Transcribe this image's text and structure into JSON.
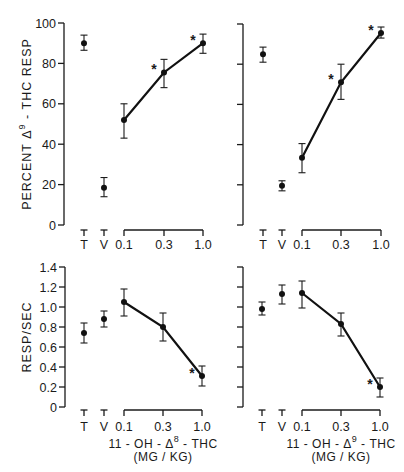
{
  "figure": {
    "background": "#ffffff",
    "ink": "#111111"
  },
  "chart_data": [
    {
      "id": "top-left",
      "type": "scatter",
      "title": "",
      "ylabel": "PERCENT Δ9 - THC RESP",
      "ylabel_parts": {
        "pre": "PERCENT Δ",
        "sup": "9",
        "post": " - THC RESP"
      },
      "xlabel": "",
      "ylim": [
        0,
        100
      ],
      "yticks": [
        0,
        20,
        40,
        60,
        80,
        100
      ],
      "ytick_labels": [
        "0",
        "20",
        "40",
        "60",
        "80",
        "100"
      ],
      "controls": [
        {
          "label": "T",
          "value": 90,
          "err_low": 86.5,
          "err_high": 94
        },
        {
          "label": "V",
          "value": 18.5,
          "err_low": 14,
          "err_high": 23.5
        }
      ],
      "dose_ticks": [
        "0.1",
        "0.3",
        "1.0"
      ],
      "series": [
        {
          "name": "11-OH-Δ8-THC",
          "x": [
            0.1,
            0.3,
            1.0
          ],
          "values": [
            52,
            75.5,
            90
          ],
          "err_low": [
            43,
            68,
            85
          ],
          "err_high": [
            60,
            82,
            94.5
          ],
          "significant": [
            false,
            true,
            true
          ]
        }
      ]
    },
    {
      "id": "top-right",
      "type": "scatter",
      "title": "",
      "ylabel": "",
      "xlabel": "",
      "ylim": [
        0,
        100
      ],
      "yticks": [
        0,
        20,
        40,
        60,
        80,
        100
      ],
      "ytick_labels": [],
      "controls": [
        {
          "label": "T",
          "value": 85,
          "err_low": 81,
          "err_high": 88.5
        },
        {
          "label": "V",
          "value": 19.5,
          "err_low": 17,
          "err_high": 22
        }
      ],
      "dose_ticks": [
        "0.1",
        "0.3",
        "1.0"
      ],
      "series": [
        {
          "name": "11-OH-Δ9-THC",
          "x": [
            0.1,
            0.3,
            1.0
          ],
          "values": [
            33.5,
            71,
            95.5
          ],
          "err_low": [
            26,
            62.5,
            93
          ],
          "err_high": [
            40.5,
            80,
            98.5
          ],
          "significant": [
            false,
            true,
            true
          ]
        }
      ]
    },
    {
      "id": "bottom-left",
      "type": "scatter",
      "title": "",
      "ylabel": "RESP/SEC",
      "ylabel_parts": {
        "pre": "RESP/SEC",
        "sup": "",
        "post": ""
      },
      "xlabel": "11 - OH - Δ8 - THC (MG / KG)",
      "xlabel_parts": {
        "pre": "11 - OH - Δ",
        "sup": "8",
        "post": " - THC",
        "units": "(MG / KG)"
      },
      "ylim": [
        0,
        1.4
      ],
      "yticks": [
        0,
        0.2,
        0.4,
        0.6,
        0.8,
        1.0,
        1.2,
        1.4
      ],
      "ytick_labels": [
        "0",
        "0.2",
        "0.4",
        "0.6",
        "0.8",
        "1.0",
        "1.2",
        "1.4"
      ],
      "controls": [
        {
          "label": "T",
          "value": 0.74,
          "err_low": 0.64,
          "err_high": 0.84
        },
        {
          "label": "V",
          "value": 0.88,
          "err_low": 0.8,
          "err_high": 0.96
        }
      ],
      "dose_ticks": [
        "0.1",
        "0.3",
        "1.0"
      ],
      "series": [
        {
          "name": "11-OH-Δ8-THC",
          "x": [
            0.1,
            0.3,
            1.0
          ],
          "values": [
            1.05,
            0.8,
            0.31
          ],
          "err_low": [
            0.91,
            0.66,
            0.21
          ],
          "err_high": [
            1.18,
            0.94,
            0.41
          ],
          "significant": [
            false,
            false,
            true
          ]
        }
      ]
    },
    {
      "id": "bottom-right",
      "type": "scatter",
      "title": "",
      "ylabel": "",
      "xlabel": "11 - OH - Δ9 - THC (MG / KG)",
      "xlabel_parts": {
        "pre": "11 - OH - Δ",
        "sup": "9",
        "post": " - THC",
        "units": "(MG / KG)"
      },
      "ylim": [
        0,
        1.4
      ],
      "yticks": [
        0,
        0.2,
        0.4,
        0.6,
        0.8,
        1.0,
        1.2,
        1.4
      ],
      "ytick_labels": [],
      "controls": [
        {
          "label": "T",
          "value": 0.98,
          "err_low": 0.92,
          "err_high": 1.05
        },
        {
          "label": "V",
          "value": 1.13,
          "err_low": 1.03,
          "err_high": 1.22
        },
        {
          "label": "",
          "value": null
        }
      ],
      "dose_ticks": [
        "0.1",
        "0.3",
        "1.0"
      ],
      "series": [
        {
          "name": "11-OH-Δ9-THC",
          "x": [
            0.1,
            0.3,
            1.0
          ],
          "values": [
            1.14,
            0.83,
            0.2
          ],
          "err_low": [
            0.99,
            0.71,
            0.1
          ],
          "err_high": [
            1.26,
            0.94,
            0.29
          ],
          "significant": [
            false,
            false,
            true
          ]
        }
      ]
    }
  ],
  "significance_marker": "*"
}
